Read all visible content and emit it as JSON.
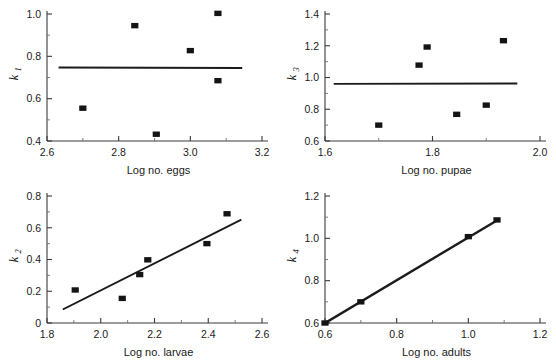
{
  "figure": {
    "title": "",
    "panel_count": 4,
    "layout": "2x2 grid of scatter plots with fitted regression lines"
  },
  "chart_data": [
    {
      "type": "scatter",
      "panel_id": "k1-vs-log-eggs",
      "title": "",
      "xlabel": "Log no. eggs",
      "ylabel": "k",
      "ylabel_subscript": "1",
      "xlim": [
        2.6,
        3.2
      ],
      "ylim": [
        0.4,
        1.0
      ],
      "xticks": [
        2.6,
        2.8,
        3.0,
        3.2
      ],
      "xtick_labels": [
        "2.6",
        "2.8",
        "3.0",
        "3.2"
      ],
      "yticks": [
        0.4,
        0.6,
        0.8,
        1.0
      ],
      "ytick_labels": [
        "0.4",
        "0.6",
        "0.8",
        "1.0"
      ],
      "xminor_step": 0.1,
      "yminor_step": 0.1,
      "grid": false,
      "legend": null,
      "marker": "filled-square",
      "points": [
        {
          "x": 2.7,
          "y": 0.555
        },
        {
          "x": 2.845,
          "y": 0.945
        },
        {
          "x": 2.905,
          "y": 0.432
        },
        {
          "x": 3.0,
          "y": 0.827
        },
        {
          "x": 3.077,
          "y": 1.003
        },
        {
          "x": 3.077,
          "y": 0.685
        }
      ],
      "fit_line": {
        "x_start": 2.635,
        "y_start": 0.747,
        "x_end": 3.142,
        "y_end": 0.745,
        "slope": -0.004,
        "description": "near-horizontal, no relationship"
      }
    },
    {
      "type": "scatter",
      "panel_id": "k3-vs-log-pupae",
      "title": "",
      "xlabel": "Log no. pupae",
      "ylabel": "k",
      "ylabel_subscript": "3",
      "xlim": [
        1.6,
        2.0
      ],
      "ylim": [
        0.6,
        1.4
      ],
      "xticks": [
        1.6,
        1.8,
        2.0
      ],
      "xtick_labels": [
        "1.6",
        "1.8",
        "2.0"
      ],
      "yticks": [
        0.6,
        0.8,
        1.0,
        1.2,
        1.4
      ],
      "ytick_labels": [
        "0.6",
        "0.8",
        "1.0",
        "1.2",
        "1.4"
      ],
      "xminor_step": 0.1,
      "yminor_step": 0.1,
      "grid": false,
      "legend": null,
      "marker": "filled-square",
      "points": [
        {
          "x": 1.7,
          "y": 0.7
        },
        {
          "x": 1.775,
          "y": 1.078
        },
        {
          "x": 1.79,
          "y": 1.192
        },
        {
          "x": 1.845,
          "y": 0.768
        },
        {
          "x": 1.9,
          "y": 0.826
        },
        {
          "x": 1.932,
          "y": 1.232
        }
      ],
      "fit_line": {
        "x_start": 1.618,
        "y_start": 0.96,
        "x_end": 1.956,
        "y_end": 0.962,
        "slope": 0.006,
        "description": "near-horizontal, no relationship"
      }
    },
    {
      "type": "scatter",
      "panel_id": "k2-vs-log-larvae",
      "title": "",
      "xlabel": "Log no. larvae",
      "ylabel": "k",
      "ylabel_subscript": "2",
      "xlim": [
        1.8,
        2.6
      ],
      "ylim": [
        0.0,
        0.8
      ],
      "xticks": [
        1.8,
        2.0,
        2.2,
        2.4,
        2.6
      ],
      "xtick_labels": [
        "1.8",
        "2.0",
        "2.2",
        "2.4",
        "2.6"
      ],
      "yticks": [
        0.0,
        0.2,
        0.4,
        0.6,
        0.8
      ],
      "ytick_labels": [
        "0",
        "0.2",
        "0.4",
        "0.6",
        "0.8"
      ],
      "xminor_step": 0.1,
      "yminor_step": 0.1,
      "grid": false,
      "legend": null,
      "marker": "filled-square",
      "points": [
        {
          "x": 1.905,
          "y": 0.208
        },
        {
          "x": 2.08,
          "y": 0.155
        },
        {
          "x": 2.145,
          "y": 0.305
        },
        {
          "x": 2.175,
          "y": 0.398
        },
        {
          "x": 2.395,
          "y": 0.5
        },
        {
          "x": 2.47,
          "y": 0.688
        }
      ],
      "fit_line": {
        "x_start": 1.862,
        "y_start": 0.088,
        "x_end": 2.52,
        "y_end": 0.648,
        "slope": 0.851,
        "description": "strong positive density-dependent trend"
      }
    },
    {
      "type": "scatter",
      "panel_id": "k4-vs-log-adults",
      "title": "",
      "xlabel": "Log no. adults",
      "ylabel": "k",
      "ylabel_subscript": "4",
      "xlim": [
        0.6,
        1.2
      ],
      "ylim": [
        0.6,
        1.2
      ],
      "xticks": [
        0.6,
        0.8,
        1.0,
        1.2
      ],
      "xtick_labels": [
        "0.6",
        "0.8",
        "1.0",
        "1.2"
      ],
      "yticks": [
        0.6,
        0.8,
        1.0,
        1.2
      ],
      "ytick_labels": [
        "0.6",
        "0.8",
        "1.0",
        "1.2"
      ],
      "xminor_step": 0.1,
      "yminor_step": 0.1,
      "grid": false,
      "legend": null,
      "marker": "filled-square",
      "points": [
        {
          "x": 0.6,
          "y": 0.6
        },
        {
          "x": 0.7,
          "y": 0.7
        },
        {
          "x": 1.0,
          "y": 1.008
        },
        {
          "x": 1.08,
          "y": 1.087
        }
      ],
      "fit_line": {
        "x_start": 0.6,
        "y_start": 0.6,
        "x_end": 1.085,
        "y_end": 1.09,
        "slope": 1.01,
        "description": "near-perfect 1:1 linear relationship"
      }
    }
  ],
  "style": {
    "marker_color": "#141414",
    "line_color": "#1b1b1b",
    "axis_color": "#3a3a3a",
    "text_color": "#1a1a1a",
    "background": "#ffffff"
  }
}
